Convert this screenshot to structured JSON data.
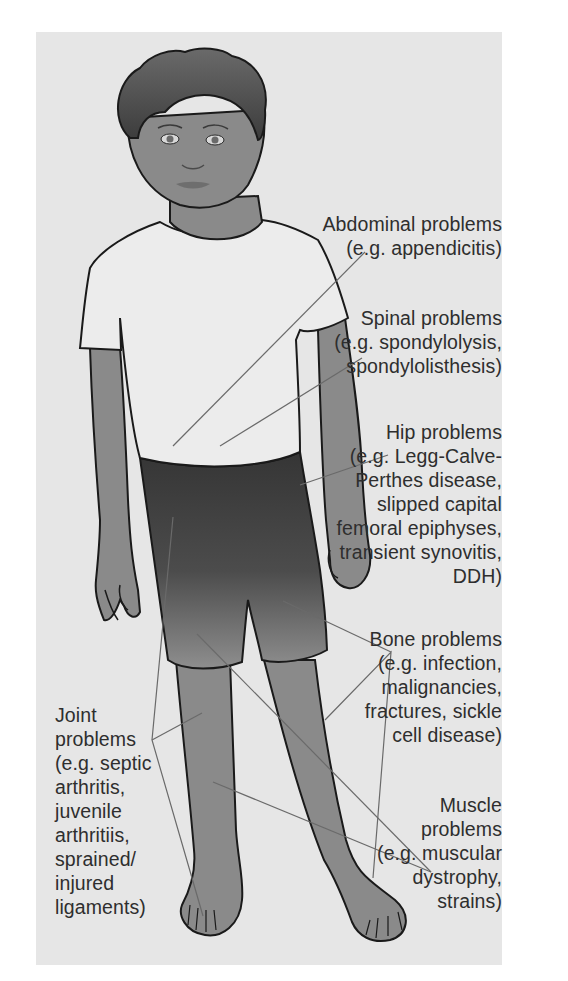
{
  "figure": {
    "colors": {
      "background_panel": "#e6e6e6",
      "page": "#ffffff",
      "skin": "#8a8a8a",
      "hair": "#4a4a4a",
      "shirt": "#ececec",
      "shorts_top": "#3a3a3a",
      "shorts_bottom": "#8c8c8c",
      "outline": "#1a1a1a",
      "leader_line": "#6a6a6a",
      "text": "#2e2e2e"
    }
  },
  "labels": {
    "abdominal": {
      "lines": [
        "Abdominal problems",
        "(e.g. appendicitis)"
      ]
    },
    "spinal": {
      "lines": [
        "Spinal problems",
        "(e.g. spondylolysis,",
        "spondylolisthesis)"
      ]
    },
    "hip": {
      "lines": [
        "Hip problems",
        "(e.g. Legg-Calve-",
        "Perthes disease,",
        "slipped capital",
        "femoral epiphyses,",
        "transient synovitis,",
        "DDH)"
      ]
    },
    "bone": {
      "lines": [
        "Bone problems",
        "(e.g. infection,",
        "malignancies,",
        "fractures, sickle",
        "cell disease)"
      ]
    },
    "muscle": {
      "lines": [
        "Muscle",
        "problems",
        "(e.g. muscular",
        "dystrophy,",
        "strains)"
      ]
    },
    "joint": {
      "lines": [
        "Joint",
        "problems",
        "(e.g. septic",
        "arthritis,",
        "juvenile",
        "arthritiis,",
        "sprained/",
        "injured",
        "ligaments)"
      ]
    }
  }
}
